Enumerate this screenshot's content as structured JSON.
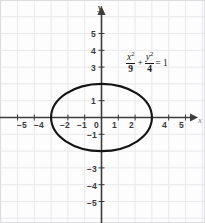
{
  "figure": {
    "name": "ellipse-coordinate-graph",
    "width": 205,
    "height": 223,
    "background_color": "#fdfdfd",
    "grid_color": "#e8e8ea",
    "border_color": "#dcdcde",
    "axis_color": "#404040",
    "curve_color": "#141414"
  },
  "axes": {
    "x_label": "x",
    "y_label": "y",
    "x_ticks_visible": [
      "−5",
      "−4",
      "−2",
      "−1",
      "0",
      "1",
      "2",
      "4",
      "5"
    ],
    "y_ticks_visible": [
      "5",
      "4",
      "3",
      "1",
      "−1",
      "−3",
      "−4",
      "−5"
    ],
    "x_range": [
      -6,
      6
    ],
    "y_range": [
      -6,
      6
    ],
    "grid": true,
    "pixels_per_unit": 16.8,
    "origin_px": [
      101.5,
      117.5
    ]
  },
  "tick_labels_x": [
    {
      "text": "−5",
      "value": -5,
      "left": 17,
      "top": 121
    },
    {
      "text": "−4",
      "value": -4,
      "left": 34,
      "top": 121
    },
    {
      "text": "−2",
      "value": -2,
      "left": 60,
      "top": 121
    },
    {
      "text": "−1",
      "value": -1,
      "left": 77,
      "top": 121
    },
    {
      "text": "0",
      "value": 0,
      "left": 94,
      "top": 121
    },
    {
      "text": "1",
      "value": 1,
      "left": 112,
      "top": 121
    },
    {
      "text": "2",
      "value": 2,
      "left": 129,
      "top": 121
    },
    {
      "text": "4",
      "value": 4,
      "left": 162,
      "top": 121
    },
    {
      "text": "5",
      "value": 5,
      "left": 179,
      "top": 121
    }
  ],
  "tick_labels_y": [
    {
      "text": "5",
      "value": 5,
      "left": 91,
      "top": 30
    },
    {
      "text": "4",
      "value": 4,
      "left": 91,
      "top": 47
    },
    {
      "text": "3",
      "value": 3,
      "left": 91,
      "top": 64
    },
    {
      "text": "1",
      "value": 1,
      "left": 91,
      "top": 97
    },
    {
      "text": "−1",
      "value": -1,
      "left": 87,
      "top": 131
    },
    {
      "text": "−3",
      "value": -3,
      "left": 87,
      "top": 165
    },
    {
      "text": "−4",
      "value": -4,
      "left": 87,
      "top": 182
    },
    {
      "text": "−5",
      "value": -5,
      "left": 87,
      "top": 199
    }
  ],
  "equation": {
    "full_text": "x²/9 + y²/4 = 1",
    "term1_numerator": "x",
    "term1_exponent": "2",
    "term1_denominator": "9",
    "operator": "+",
    "term2_numerator": "y",
    "term2_exponent": "2",
    "term2_denominator": "4",
    "equals": "= 1"
  },
  "chart_data": {
    "type": "line",
    "title": "",
    "xlabel": "x",
    "ylabel": "y",
    "xlim": [
      -6,
      6
    ],
    "ylim": [
      -6,
      6
    ],
    "grid": true,
    "legend": "none",
    "annotations": [
      {
        "text": "x²/9 + y²/4 = 1",
        "x": 1.5,
        "y": 3.2
      }
    ],
    "series": [
      {
        "name": "ellipse",
        "curve_type": "ellipse",
        "equation": "x^2/9 + y^2/4 = 1",
        "center": [
          0,
          0
        ],
        "semi_major_axis_a": 3,
        "semi_minor_axis_b": 2,
        "orientation": "horizontal",
        "vertices": [
          [
            -3,
            0
          ],
          [
            3,
            0
          ]
        ],
        "co_vertices": [
          [
            0,
            2
          ],
          [
            0,
            -2
          ]
        ],
        "x": [
          -3,
          -2.9,
          -2.6,
          -2.2,
          -1.5,
          -0.8,
          0,
          0.8,
          1.5,
          2.2,
          2.6,
          2.9,
          3,
          2.9,
          2.6,
          2.2,
          1.5,
          0.8,
          0,
          -0.8,
          -1.5,
          -2.2,
          -2.6,
          -2.9,
          -3
        ],
        "y": [
          0,
          0.51,
          1.0,
          1.36,
          1.73,
          1.93,
          2,
          1.93,
          1.73,
          1.36,
          1.0,
          0.51,
          0,
          -0.51,
          -1.0,
          -1.36,
          -1.73,
          -1.93,
          -2,
          -1.93,
          -1.73,
          -1.36,
          -1.0,
          -0.51,
          0
        ]
      }
    ]
  }
}
